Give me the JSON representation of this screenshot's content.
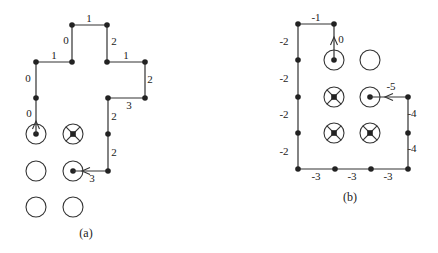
{
  "panels": [
    {
      "id": "a",
      "caption": "(a)",
      "caption_pos": [
        86,
        237
      ],
      "path_nodes": [
        [
          36,
          134
        ],
        [
          36,
          98
        ],
        [
          36,
          62
        ],
        [
          72,
          62
        ],
        [
          72,
          25
        ],
        [
          107,
          25
        ],
        [
          107,
          62
        ],
        [
          145,
          62
        ],
        [
          145,
          98
        ],
        [
          108,
          98
        ],
        [
          108,
          134
        ],
        [
          108,
          171
        ],
        [
          73,
          171
        ]
      ],
      "path_dots": [
        [
          36,
          98
        ],
        [
          36,
          62
        ],
        [
          72,
          62
        ],
        [
          72,
          25
        ],
        [
          107,
          25
        ],
        [
          107,
          62
        ],
        [
          145,
          62
        ],
        [
          145,
          98
        ],
        [
          108,
          98
        ],
        [
          108,
          134
        ],
        [
          108,
          171
        ]
      ],
      "edge_labels": [
        {
          "text": "0",
          "x": 29,
          "y": 117
        },
        {
          "text": "0",
          "x": 28,
          "y": 82
        },
        {
          "text": "1",
          "x": 54,
          "y": 59
        },
        {
          "text": "0",
          "x": 66,
          "y": 44
        },
        {
          "text": "1",
          "x": 89,
          "y": 22
        },
        {
          "text": "2",
          "x": 114,
          "y": 45
        },
        {
          "text": "1",
          "x": 126,
          "y": 59
        },
        {
          "text": "2",
          "x": 150,
          "y": 83
        },
        {
          "text": "3",
          "x": 129,
          "y": 109
        },
        {
          "text": "2",
          "x": 114,
          "y": 120
        },
        {
          "text": "2",
          "x": 114,
          "y": 156
        },
        {
          "text": "3",
          "x": 92,
          "y": 182
        }
      ],
      "arrows": [
        {
          "tip": [
            36,
            121
          ],
          "dir": "up"
        },
        {
          "tip": [
            82,
            171
          ],
          "dir": "left"
        }
      ],
      "circles": [
        {
          "cx": 36,
          "cy": 134,
          "type": "dot"
        },
        {
          "cx": 73,
          "cy": 134,
          "type": "cross"
        },
        {
          "cx": 36,
          "cy": 171,
          "type": "empty"
        },
        {
          "cx": 73,
          "cy": 171,
          "type": "dot"
        },
        {
          "cx": 36,
          "cy": 207,
          "type": "empty"
        },
        {
          "cx": 73,
          "cy": 207,
          "type": "empty"
        }
      ]
    },
    {
      "id": "b",
      "caption": "(b)",
      "caption_pos": [
        350,
        201
      ],
      "path_nodes": [
        [
          334,
          60
        ],
        [
          334,
          24
        ],
        [
          298,
          24
        ],
        [
          298,
          60
        ],
        [
          298,
          97
        ],
        [
          298,
          133
        ],
        [
          298,
          169
        ],
        [
          335,
          169
        ],
        [
          371,
          169
        ],
        [
          408,
          169
        ],
        [
          408,
          133
        ],
        [
          408,
          97
        ],
        [
          370,
          97
        ]
      ],
      "path_dots": [
        [
          334,
          24
        ],
        [
          298,
          24
        ],
        [
          298,
          60
        ],
        [
          298,
          97
        ],
        [
          298,
          133
        ],
        [
          298,
          169
        ],
        [
          335,
          169
        ],
        [
          371,
          169
        ],
        [
          408,
          169
        ],
        [
          408,
          133
        ],
        [
          408,
          97
        ]
      ],
      "edge_labels": [
        {
          "text": "-1",
          "x": 316,
          "y": 21
        },
        {
          "text": "0",
          "x": 341,
          "y": 43
        },
        {
          "text": "-2",
          "x": 284,
          "y": 45
        },
        {
          "text": "-2",
          "x": 284,
          "y": 82
        },
        {
          "text": "-2",
          "x": 284,
          "y": 118
        },
        {
          "text": "-2",
          "x": 284,
          "y": 155
        },
        {
          "text": "-3",
          "x": 316,
          "y": 180
        },
        {
          "text": "-3",
          "x": 352,
          "y": 180
        },
        {
          "text": "-3",
          "x": 388,
          "y": 180
        },
        {
          "text": "-4",
          "x": 412,
          "y": 152
        },
        {
          "text": "-4",
          "x": 412,
          "y": 117
        },
        {
          "text": "-5",
          "x": 391,
          "y": 90
        }
      ],
      "arrows": [
        {
          "tip": [
            334,
            37
          ],
          "dir": "up"
        },
        {
          "tip": [
            385,
            97
          ],
          "dir": "left"
        }
      ],
      "circles": [
        {
          "cx": 334,
          "cy": 60,
          "type": "dot"
        },
        {
          "cx": 370,
          "cy": 60,
          "type": "empty"
        },
        {
          "cx": 334,
          "cy": 97,
          "type": "cross"
        },
        {
          "cx": 370,
          "cy": 97,
          "type": "dot"
        },
        {
          "cx": 334,
          "cy": 133,
          "type": "cross"
        },
        {
          "cx": 370,
          "cy": 133,
          "type": "cross"
        }
      ]
    }
  ],
  "style": {
    "stroke": "#333333",
    "node_fill": "#222222",
    "circle_radius": 10,
    "node_radius": 2.8
  }
}
